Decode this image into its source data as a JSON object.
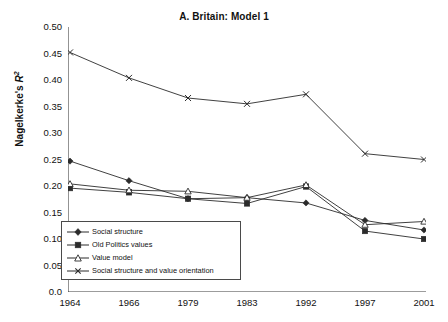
{
  "chart_data": {
    "type": "line",
    "title": "A. Britain: Model 1",
    "xlabel": "",
    "ylabel": "Nagelkerke's R²",
    "ylabel_base": "Nagelkerke's ",
    "ylabel_var": "R",
    "ylabel_exp": "2",
    "categories": [
      "1964",
      "1966",
      "1979",
      "1983",
      "1992",
      "1997",
      "2001"
    ],
    "ylim": [
      0.0,
      0.5
    ],
    "ytick_labels": [
      "0.50",
      "0.45",
      "0.40",
      "0.35",
      "0.30",
      "0.25",
      "0.20",
      "0.15",
      "0.10",
      "0.05",
      "0.0"
    ],
    "ytick_values": [
      0.5,
      0.45,
      0.4,
      0.35,
      0.3,
      0.25,
      0.2,
      0.15,
      0.1,
      0.05,
      0.0
    ],
    "grid": false,
    "legend_position": "lower-left",
    "series": [
      {
        "name": "Social structure",
        "marker": "filled-diamond",
        "color": "#2b2b2b",
        "values": [
          0.247,
          0.21,
          0.176,
          0.178,
          0.168,
          0.135,
          0.117
        ]
      },
      {
        "name": "Old Politics values",
        "marker": "filled-square",
        "color": "#2b2b2b",
        "values": [
          0.196,
          0.188,
          0.176,
          0.167,
          0.199,
          0.115,
          0.1
        ]
      },
      {
        "name": "Value model",
        "marker": "open-triangle",
        "color": "#2b2b2b",
        "values": [
          0.204,
          0.192,
          0.19,
          0.178,
          0.202,
          0.127,
          0.133
        ]
      },
      {
        "name": "Social structure and value orientation",
        "marker": "cross-star",
        "color": "#2b2b2b",
        "values": [
          0.452,
          0.404,
          0.366,
          0.355,
          0.373,
          0.261,
          0.25
        ]
      }
    ]
  },
  "legend": {
    "items": [
      {
        "label": "Social structure"
      },
      {
        "label": "Old Politics values"
      },
      {
        "label": "Value model"
      },
      {
        "label": "Social structure and value orientation"
      }
    ]
  },
  "colors": {
    "axis": "#3a3a3a",
    "line": "#2b2b2b",
    "background": "#ffffff",
    "legend_border": "#4a4a4a"
  }
}
